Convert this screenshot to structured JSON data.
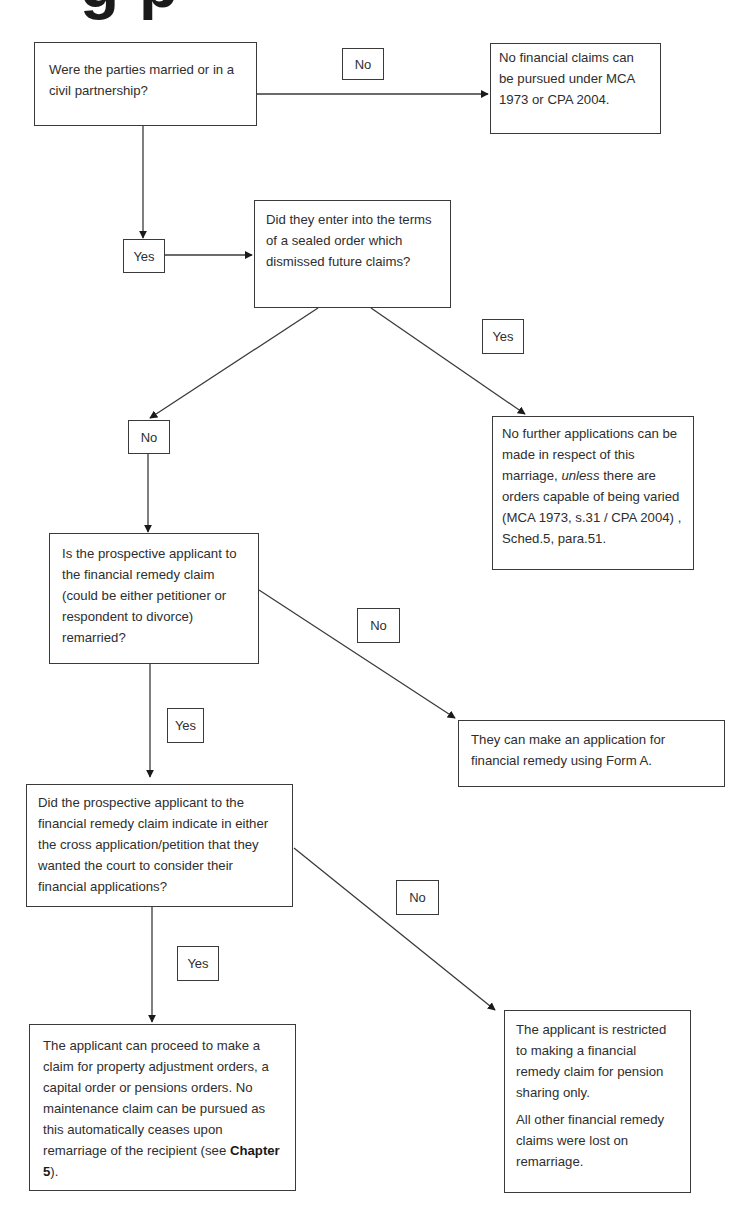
{
  "heading": {
    "text": "g p"
  },
  "nodes": {
    "q1": {
      "text": "Were the parties married or in a civil partnership?"
    },
    "r1": {
      "text": "No financial claims can be pursued under MCA 1973 or CPA 2004."
    },
    "q2": {
      "text": "Did they enter into the terms of a sealed order which dismissed future claims?"
    },
    "r2": {
      "before": "No further applications can be made in respect of this marriage, ",
      "italic": "unless",
      "after": " there are orders capable of being varied (MCA 1973, s.31 / CPA 2004) , Sched.5, para.51."
    },
    "q3": {
      "text": "Is the prospective applicant to the financial remedy claim (could be either petitioner or respondent to divorce) remarried?"
    },
    "r3": {
      "text": "They can make an application for financial remedy using Form A."
    },
    "q4": {
      "text": "Did the prospective applicant to the financial remedy claim indicate in either the cross application/petition that they wanted the court to consider their financial applications?"
    },
    "r4": {
      "before": "The applicant can proceed to make a claim for property adjustment orders, a capital order or pensions orders. No maintenance claim can be pursued as this automatically ceases upon remarriage of the recipient (see ",
      "bold": "Chapter 5",
      "after": ")."
    },
    "r5": {
      "para1": "The applicant is restricted to making a financial remedy claim for pension sharing only.",
      "para2": "All other financial remedy claims were lost on remarriage."
    }
  },
  "edge_labels": {
    "q1_no": "No",
    "q1_yes": "Yes",
    "q2_yes": "Yes",
    "q2_no": "No",
    "q3_no": "No",
    "q3_yes": "Yes",
    "q4_no": "No",
    "q4_yes": "Yes"
  }
}
